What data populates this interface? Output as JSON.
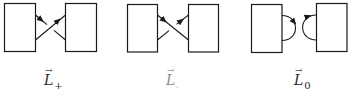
{
  "figure": {
    "panels": [
      {
        "id": "L_plus",
        "crossing_type": "positive",
        "label": {
          "base": "L",
          "subscript": "+",
          "vector_arrow": "→"
        }
      },
      {
        "id": "L_minus",
        "crossing_type": "negative",
        "label": {
          "base": "L",
          "subscript": "-",
          "vector_arrow": "→"
        }
      },
      {
        "id": "L_zero",
        "crossing_type": "smoothing",
        "label": {
          "base": "L",
          "subscript": "0",
          "vector_arrow": "→"
        }
      }
    ],
    "colors": {
      "stroke": "#1a1a1a",
      "background": "#ffffff"
    }
  }
}
